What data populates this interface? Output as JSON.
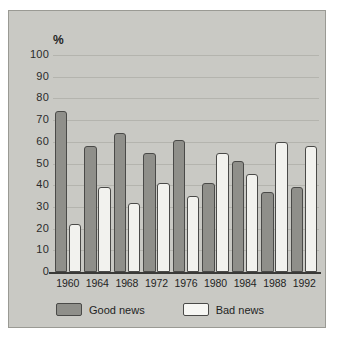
{
  "chart_data": {
    "type": "bar",
    "title": "",
    "subtitle": "",
    "xlabel": "",
    "ylabel": "%",
    "unit_symbol": "%",
    "categories": [
      "1960",
      "1964",
      "1968",
      "1972",
      "1976",
      "1980",
      "1984",
      "1988",
      "1992"
    ],
    "series": [
      {
        "name": "Good news",
        "color": "#8f8f8a",
        "values": [
          74,
          58,
          64,
          55,
          61,
          41,
          51,
          37,
          39
        ]
      },
      {
        "name": "Bad news",
        "color": "#f2f2ee",
        "values": [
          22,
          39,
          32,
          41,
          35,
          55,
          45,
          60,
          58
        ]
      }
    ],
    "ylim": [
      0,
      100
    ],
    "ytick_values": [
      0,
      10,
      20,
      30,
      40,
      50,
      60,
      70,
      80,
      90,
      100
    ],
    "ytick_labels": [
      "0",
      "10",
      "20",
      "30",
      "40",
      "50",
      "60",
      "70",
      "80",
      "90",
      "100"
    ],
    "grid": true,
    "grid_axis": "y",
    "legend_position": "bottom-left",
    "legend_entries": [
      "Good news",
      "Bad news"
    ]
  },
  "colors": {
    "plate_background": "#c9c9c4",
    "plate_border": "#9a9a94",
    "gridline": "#b4b4ae",
    "axis": "#3a3a38",
    "bar_outline": "#4a4a48",
    "good_news_fill": "#8f8f8a",
    "bad_news_fill": "#f2f2ee",
    "text": "#1f1f1f"
  }
}
